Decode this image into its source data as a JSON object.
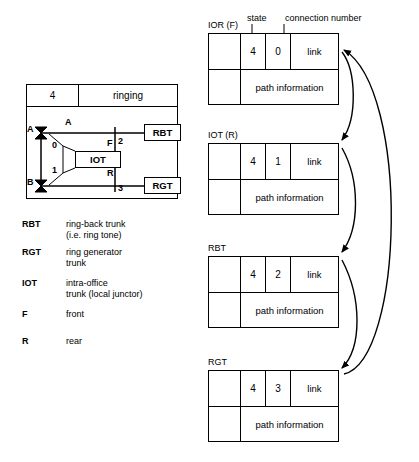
{
  "call_panel": {
    "state_value": "4",
    "state_name": "ringing",
    "line_a_label": "A",
    "line_b_label": "B",
    "bus_a_label": "A",
    "junctor_label": "IOT",
    "junctor_front": "F",
    "junctor_rear": "R",
    "port_0": "0",
    "port_1": "1",
    "port_2": "2",
    "port_3": "3",
    "trunk_rbt": "RBT",
    "trunk_rgt": "RGT"
  },
  "legend": [
    {
      "abbr": "RBT",
      "desc": "ring-back trunk\n(i.e. ring tone)"
    },
    {
      "abbr": "RGT",
      "desc": "ring generator\ntrunk"
    },
    {
      "abbr": "IOT",
      "desc": "intra-office\ntrunk (local junctor)"
    },
    {
      "abbr": "F",
      "desc": "front"
    },
    {
      "abbr": "R",
      "desc": "rear"
    }
  ],
  "annotations": {
    "state_caption": "state",
    "connection_caption": "connection number"
  },
  "records": [
    {
      "title": "IOR (F)",
      "state": "4",
      "connection": "0",
      "link": "link",
      "path": "path information"
    },
    {
      "title": "IOT (R)",
      "state": "4",
      "connection": "1",
      "link": "link",
      "path": "path information"
    },
    {
      "title": "RBT",
      "state": "4",
      "connection": "2",
      "link": "link",
      "path": "path information"
    },
    {
      "title": "RGT",
      "state": "4",
      "connection": "3",
      "link": "link",
      "path": "path information"
    }
  ],
  "colors": {
    "line": "#000000",
    "background": "#ffffff"
  }
}
